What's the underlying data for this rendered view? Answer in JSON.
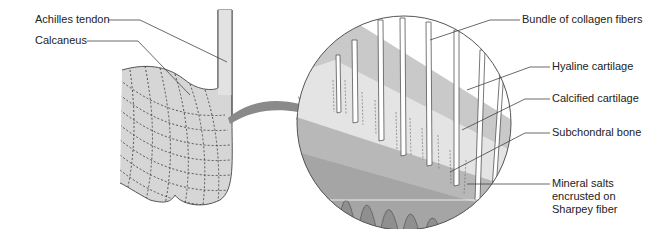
{
  "figure": {
    "left_panel": {
      "name": "heel bone overview",
      "labels": [
        {
          "id": "achilles",
          "text": "Achilles tendon"
        },
        {
          "id": "calcaneus",
          "text": "Calcaneus"
        }
      ]
    },
    "arrow": {
      "direction": "right",
      "meaning": "magnified view"
    },
    "right_panel": {
      "name": "magnified enthesis cross-section",
      "labels": [
        {
          "id": "collagen",
          "text": "Bundle of collagen fibers"
        },
        {
          "id": "hyaline",
          "text": "Hyaline cartilage"
        },
        {
          "id": "calcified",
          "text": "Calcified cartilage"
        },
        {
          "id": "subchondral",
          "text": "Subchondral bone"
        },
        {
          "id": "mineral",
          "text": "Mineral salts\nencrusted on\nSharpey fiber"
        }
      ]
    },
    "colors": {
      "bone_fill": "#d4d4d4",
      "tendon_fill": "#dcdcdc",
      "outline": "#555555",
      "arrow": "#8a8a8a",
      "hyaline": "#c9c9c9",
      "calcified": "#e4e4e4",
      "subchondral": "#b8b8b8",
      "fiber": "#ffffff"
    }
  }
}
